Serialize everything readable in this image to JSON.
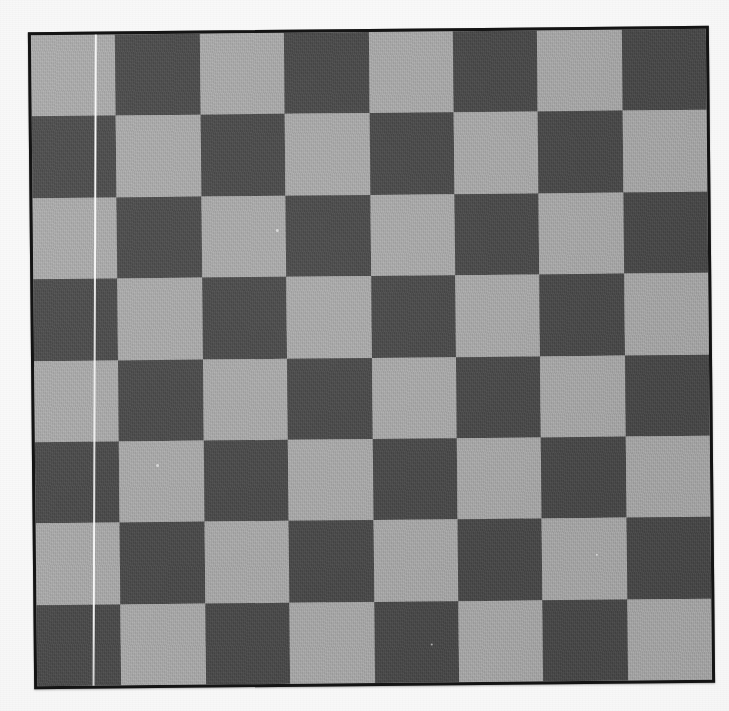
{
  "scene": {
    "title": "Checkerboard calibration target photograph",
    "background_color": "#fbfbfb",
    "width": 729,
    "height": 711
  },
  "board": {
    "name": "checkerboard",
    "rows": 8,
    "columns": 8,
    "total_squares": 64,
    "rotation_degrees": -0.55,
    "light_color": "#a6a6a6",
    "dark_color": "#4b4b4b",
    "border_color": "#141414",
    "border_width_px": 3,
    "top_left_square_color": "light",
    "square_width_px": 85,
    "square_height_px": 82,
    "pattern": [
      [
        "light",
        "dark",
        "light",
        "dark",
        "light",
        "dark",
        "light",
        "dark"
      ],
      [
        "dark",
        "light",
        "dark",
        "light",
        "dark",
        "light",
        "dark",
        "light"
      ],
      [
        "light",
        "dark",
        "light",
        "dark",
        "light",
        "dark",
        "light",
        "dark"
      ],
      [
        "dark",
        "light",
        "dark",
        "light",
        "dark",
        "light",
        "dark",
        "light"
      ],
      [
        "light",
        "dark",
        "light",
        "dark",
        "light",
        "dark",
        "light",
        "dark"
      ],
      [
        "dark",
        "light",
        "dark",
        "light",
        "dark",
        "light",
        "dark",
        "light"
      ],
      [
        "light",
        "dark",
        "light",
        "dark",
        "light",
        "dark",
        "light",
        "dark"
      ],
      [
        "dark",
        "light",
        "dark",
        "light",
        "dark",
        "light",
        "dark",
        "light"
      ]
    ]
  },
  "artifacts": {
    "scratch_line": {
      "name": "white-scratch-line",
      "description": "thin pale vertical thread running the full height near the left edge",
      "color": "#ffffff",
      "orientation": "vertical",
      "tilt_degrees": 0.75
    },
    "specks": [
      {
        "x": 243,
        "y": 196,
        "size": 3
      },
      {
        "x": 121,
        "y": 430,
        "size": 3
      },
      {
        "x": 560,
        "y": 524,
        "size": 2
      },
      {
        "x": 394,
        "y": 612,
        "size": 2
      }
    ],
    "texture": "film grain / canvas weave"
  }
}
